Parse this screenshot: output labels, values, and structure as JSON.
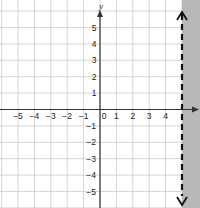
{
  "chart_data": {
    "type": "inequality-graph",
    "title": "",
    "xlabel": "x",
    "ylabel": "y",
    "xlim": [
      -6,
      6
    ],
    "ylim": [
      -6,
      6
    ],
    "grid": true,
    "x_ticks": [
      "−5",
      "−4",
      "−3",
      "−2",
      "−1",
      "0",
      "1",
      "2",
      "3",
      "4"
    ],
    "y_ticks_positive": [
      "5",
      "4",
      "3",
      "2",
      "1"
    ],
    "y_ticks_negative": [
      "−1",
      "−2",
      "−3",
      "−4",
      "−5"
    ],
    "boundary": {
      "type": "vertical-line",
      "x": 5,
      "style": "dashed"
    },
    "shaded_region": "x > 5",
    "inequality": "x > 5",
    "colors": {
      "shade": "#b8b8b8",
      "grid": "#cccccc",
      "axis": "#333333",
      "boundary": "#111111"
    }
  },
  "labels": {
    "x_axis": "x",
    "y_axis": "y"
  }
}
